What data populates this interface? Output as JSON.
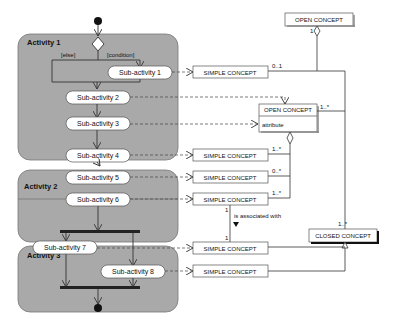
{
  "activities": [
    {
      "title": "Activity 1",
      "subactivities": [
        "Sub-activity 1",
        "Sub-activity 2",
        "Sub-activity 3"
      ]
    },
    {
      "title": "Activity 2",
      "subactivities": [
        "Sub-activity 4",
        "Sub-activity 5",
        "Sub-activity 6"
      ]
    },
    {
      "title": "Activity 3",
      "subactivities": [
        "Sub-activity 7",
        "Sub-activity 8"
      ]
    }
  ],
  "guards": {
    "else": "[else]",
    "condition": "[condition]"
  },
  "concepts": {
    "open_top": "OPEN CONCEPT",
    "open_mid": "OPEN CONCEPT",
    "open_mid_attribute": "attribute",
    "simple": [
      "SIMPLE CONCEPT",
      "SIMPLE CONCEPT",
      "SIMPLE CONCEPT",
      "SIMPLE CONCEPT",
      "SIMPLE CONCEPT",
      "SIMPLE CONCEPT"
    ],
    "closed": "CLOSED CONCEPT"
  },
  "multiplicities": {
    "s1": "0..1",
    "open_top_agg": "1",
    "open_mid_right": "1..*",
    "s4": "1..*",
    "s5": "0..*",
    "s6": "1..*",
    "assoc_top": "1",
    "assoc_bottom": "1",
    "closed_top": "1..*"
  },
  "association_label": "is associated with"
}
